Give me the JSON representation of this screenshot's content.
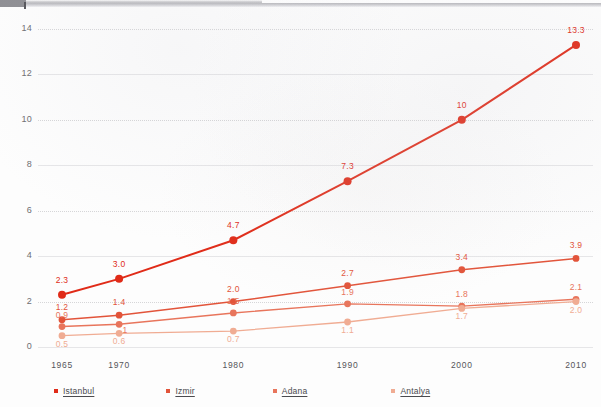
{
  "chart_data": {
    "type": "line",
    "title": "",
    "xlabel": "",
    "ylabel": "",
    "x": [
      1965,
      1970,
      1980,
      1990,
      2000,
      2010
    ],
    "categories": [
      "1965",
      "1970",
      "1980",
      "1990",
      "2000",
      "2010"
    ],
    "xlim": [
      1962,
      2013
    ],
    "ylim": [
      0,
      14.6
    ],
    "yticks": [
      "0",
      "2",
      "4",
      "6",
      "8",
      "10",
      "12",
      "14"
    ],
    "ytick_values": [
      0,
      2,
      4,
      6,
      8,
      10,
      12,
      14
    ],
    "grid": true,
    "legend_position": "bottom",
    "series": [
      {
        "name": "Istanbul",
        "color": "#e02b18",
        "values": [
          2.3,
          3.0,
          4.7,
          7.3,
          10,
          13.3
        ],
        "labels": [
          "2.3",
          "3.0",
          "4.7",
          "7.3",
          "10",
          "13.3"
        ]
      },
      {
        "name": "Izmir",
        "color": "#e2543a",
        "values": [
          1.2,
          1.4,
          2.0,
          2.7,
          3.4,
          3.9
        ],
        "labels": [
          "1.2",
          "1.4",
          "2.0",
          "2.7",
          "3.4",
          "3.9"
        ]
      },
      {
        "name": "Adana",
        "color": "#e8755c",
        "values": [
          0.9,
          1.0,
          1.5,
          1.9,
          1.8,
          2.1
        ],
        "labels": [
          "0.9",
          "1",
          "1.5",
          "1.9",
          "1.8",
          "2.1"
        ]
      },
      {
        "name": "Antalya",
        "color": "#f0ac93",
        "values": [
          0.5,
          0.6,
          0.7,
          1.1,
          1.7,
          2.0
        ],
        "labels": [
          "0.5",
          "0.6",
          "0.7",
          "1.1",
          "1.7",
          "2.0"
        ]
      }
    ]
  },
  "legend": {
    "items": [
      {
        "label": "Istanbul",
        "color": "#e02b18"
      },
      {
        "label": "Izmir",
        "color": "#e2543a"
      },
      {
        "label": "Adana",
        "color": "#e8755c"
      },
      {
        "label": "Antalya",
        "color": "#f0ac93"
      }
    ]
  },
  "axes": {
    "ytick_labels": [
      "14",
      "12",
      "10",
      "8",
      "6",
      "4",
      "2",
      "0"
    ],
    "xtick_labels": [
      "1965",
      "1970",
      "1980",
      "1990",
      "2000",
      "2010"
    ]
  }
}
